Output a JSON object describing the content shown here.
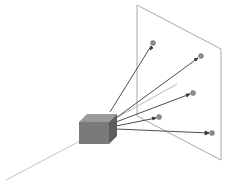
{
  "diagram": {
    "title": "",
    "colors": {
      "background": "#ffffff",
      "plane_stroke": "#a8a8a8",
      "cube_front": "#7a7a7a",
      "cube_top": "#9a9a9a",
      "cube_side": "#5e5e5e",
      "ray": "#3a3a3a",
      "axis_line": "#c4c4c4",
      "dot_fill": "#8c8c8c"
    },
    "plane": {
      "points": "137,5 221,49 221,160 137,116"
    },
    "cube": {
      "x": 79,
      "y": 122,
      "size": 30,
      "depth": 8
    },
    "origin": {
      "x": 116,
      "y": 122
    },
    "rays": [
      {
        "x": 153,
        "y": 43
      },
      {
        "x": 201,
        "y": 56
      },
      {
        "x": 193,
        "y": 93
      },
      {
        "x": 159,
        "y": 117
      },
      {
        "x": 212,
        "y": 133
      }
    ],
    "gray_ray": {
      "x1": 116,
      "y1": 118,
      "x2": 177,
      "y2": 84
    },
    "axis_line": {
      "x1": 6,
      "y1": 180,
      "x2": 80,
      "y2": 141
    },
    "caption": ""
  }
}
